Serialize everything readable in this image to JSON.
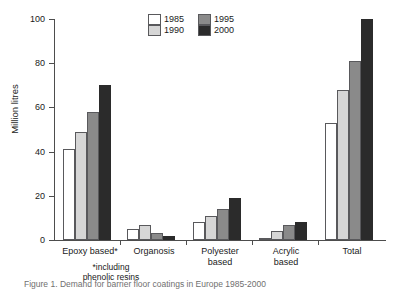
{
  "chart_data": {
    "type": "bar",
    "title": "",
    "xlabel": "",
    "ylabel": "Million litres",
    "ylim": [
      0,
      100
    ],
    "yticks": [
      0,
      20,
      40,
      60,
      80,
      100
    ],
    "grid": false,
    "legend_position": "top-center",
    "categories": [
      "Epoxy based*",
      "Organosis",
      "Polyester based",
      "Acrylic based",
      "Total"
    ],
    "series": [
      {
        "name": "1985",
        "color": "#ffffff",
        "values": [
          41,
          5,
          8,
          1,
          53
        ]
      },
      {
        "name": "1990",
        "color": "#d6d6d6",
        "values": [
          49,
          7,
          11,
          4,
          68
        ]
      },
      {
        "name": "1995",
        "color": "#8a8a8a",
        "values": [
          58,
          3,
          14,
          7,
          81
        ]
      },
      {
        "name": "2000",
        "color": "#2b2b2b",
        "values": [
          70,
          2,
          19,
          8,
          100
        ]
      }
    ],
    "annotations": [
      "*including phenolic resins"
    ]
  },
  "axis": {
    "y_title": "Million litres",
    "y_ticks": [
      "0",
      "20",
      "40",
      "60",
      "80",
      "100"
    ]
  },
  "legend": {
    "column_one": [
      {
        "label": "1985",
        "color": "#ffffff"
      },
      {
        "label": "1990",
        "color": "#d6d6d6"
      }
    ],
    "column_two": [
      {
        "label": "1995",
        "color": "#8a8a8a"
      },
      {
        "label": "2000",
        "color": "#2b2b2b"
      }
    ]
  },
  "categories": {
    "epoxy": "Epoxy based*",
    "organosis": "Organosis",
    "polyester_line1": "Polyester",
    "polyester_line2": "based",
    "acrylic_line1": "Acrylic",
    "acrylic_line2": "based",
    "total": "Total"
  },
  "footnote": {
    "line1": "*including",
    "line2": "phenolic resins"
  },
  "caption": {
    "text": "Figure 1. Demand for barrier floor coatings in Europe 1985-2000"
  }
}
